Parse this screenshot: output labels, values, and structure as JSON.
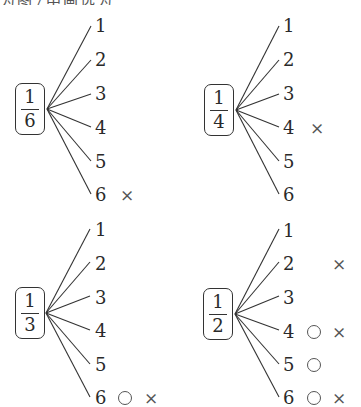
{
  "header": {
    "text": "为图7中画选为"
  },
  "trees": [
    {
      "id": "one-sixth",
      "fraction": {
        "numerator": "1",
        "denominator": "6"
      },
      "branches": [
        {
          "label": "1",
          "marks": []
        },
        {
          "label": "2",
          "marks": []
        },
        {
          "label": "3",
          "marks": []
        },
        {
          "label": "4",
          "marks": []
        },
        {
          "label": "5",
          "marks": []
        },
        {
          "label": "6",
          "marks": [
            "×"
          ]
        }
      ]
    },
    {
      "id": "one-fourth",
      "fraction": {
        "numerator": "1",
        "denominator": "4"
      },
      "branches": [
        {
          "label": "1",
          "marks": []
        },
        {
          "label": "2",
          "marks": []
        },
        {
          "label": "3",
          "marks": []
        },
        {
          "label": "4",
          "marks": [
            "×"
          ]
        },
        {
          "label": "5",
          "marks": []
        },
        {
          "label": "6",
          "marks": []
        }
      ]
    },
    {
      "id": "one-third",
      "fraction": {
        "numerator": "1",
        "denominator": "3"
      },
      "branches": [
        {
          "label": "1",
          "marks": []
        },
        {
          "label": "2",
          "marks": []
        },
        {
          "label": "3",
          "marks": [
            "×"
          ]
        },
        {
          "label": "4",
          "marks": []
        },
        {
          "label": "5",
          "marks": []
        },
        {
          "label": "6",
          "marks": [
            "○",
            "×"
          ]
        }
      ]
    },
    {
      "id": "one-half",
      "fraction": {
        "numerator": "1",
        "denominator": "2"
      },
      "branches": [
        {
          "label": "1",
          "marks": []
        },
        {
          "label": "2",
          "marks": [
            "×"
          ]
        },
        {
          "label": "3",
          "marks": []
        },
        {
          "label": "4",
          "marks": [
            "○",
            "×"
          ]
        },
        {
          "label": "5",
          "marks": [
            "○"
          ]
        },
        {
          "label": "6",
          "marks": [
            "○",
            "×"
          ]
        }
      ]
    }
  ],
  "symbols": {
    "cross": "×",
    "circle": "○"
  }
}
